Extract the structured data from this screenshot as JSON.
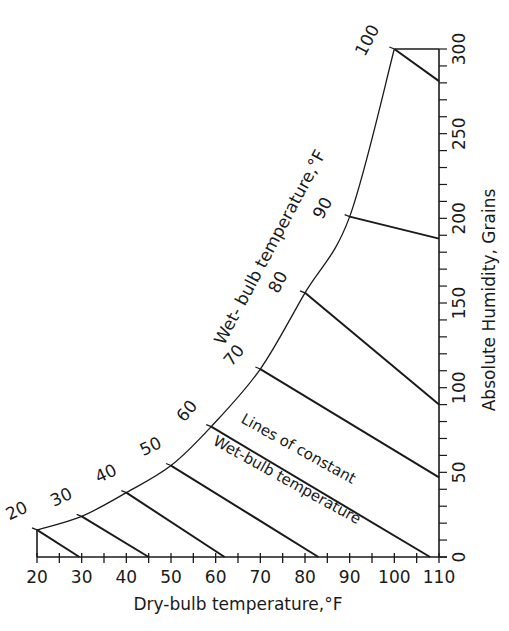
{
  "chart_data": {
    "type": "line",
    "title": "",
    "xlabel": "Dry-bulb temperature,°F",
    "ylabel": "Absolute Humidity, Grains",
    "xlim": [
      20,
      110
    ],
    "ylim": [
      0,
      300
    ],
    "x_ticks": [
      20,
      30,
      40,
      50,
      60,
      70,
      80,
      90,
      100,
      110
    ],
    "x_minor_tick_step": 5,
    "y_ticks": [
      0,
      50,
      100,
      150,
      200,
      250,
      300
    ],
    "y_minor_tick_step": 10,
    "y_axis_position": "right",
    "grid": false,
    "legend": null,
    "saturation_curve": {
      "label": "Wet- bulb temperature,°F",
      "labels": [
        "20",
        "30",
        "40",
        "50",
        "60",
        "70",
        "80",
        "90",
        "100"
      ],
      "points": [
        {
          "wb": 20,
          "db": 20,
          "grains": 16
        },
        {
          "wb": 30,
          "db": 30,
          "grains": 24
        },
        {
          "wb": 40,
          "db": 40,
          "grains": 38
        },
        {
          "wb": 50,
          "db": 50,
          "grains": 54
        },
        {
          "wb": 60,
          "db": 59,
          "grains": 77
        },
        {
          "wb": 70,
          "db": 70,
          "grains": 111
        },
        {
          "wb": 80,
          "db": 80,
          "grains": 156
        },
        {
          "wb": 90,
          "db": 90,
          "grains": 201
        },
        {
          "wb": 100,
          "db": 100,
          "grains": 300
        }
      ]
    },
    "series": [
      {
        "name": "20",
        "x": [
          20,
          29.5
        ],
        "y": [
          16,
          0
        ]
      },
      {
        "name": "30",
        "x": [
          30,
          45
        ],
        "y": [
          24,
          0
        ]
      },
      {
        "name": "40",
        "x": [
          40,
          62
        ],
        "y": [
          38,
          0
        ]
      },
      {
        "name": "50",
        "x": [
          50,
          83
        ],
        "y": [
          54,
          0
        ]
      },
      {
        "name": "60",
        "x": [
          59,
          108
        ],
        "y": [
          77,
          0
        ]
      },
      {
        "name": "70",
        "x": [
          70,
          110
        ],
        "y": [
          111,
          47
        ]
      },
      {
        "name": "80",
        "x": [
          80,
          110
        ],
        "y": [
          156,
          90
        ]
      },
      {
        "name": "90",
        "x": [
          90,
          110
        ],
        "y": [
          201,
          188
        ]
      },
      {
        "name": "100",
        "x": [
          100,
          110
        ],
        "y": [
          300,
          281
        ]
      }
    ],
    "annotations": [
      {
        "text": "Lines of constant",
        "line2": "Wet-bulb temperature"
      }
    ],
    "top_cap_line": {
      "x": [
        100,
        110
      ],
      "y": [
        300,
        300
      ]
    }
  },
  "labels": {
    "x_title": "Dry-bulb temperature,°F",
    "y_title": "Absolute Humidity, Grains",
    "curve_title": "Wet- bulb temperature,°F",
    "annot_line1": "Lines of constant",
    "annot_line2": "Wet-bulb temperature"
  },
  "colors": {
    "ink": "#1a1a1a",
    "background": "#ffffff"
  }
}
